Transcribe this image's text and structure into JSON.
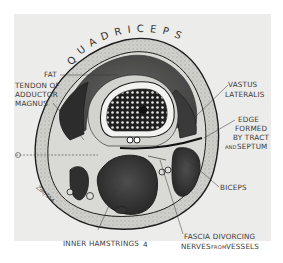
{
  "diagram": {
    "title": "QUADRICEPS",
    "background_color": "#ececea",
    "labels": {
      "fat": "FAT",
      "tendon_line1": "TENDON OF",
      "tendon_line2": "ADDUCTOR",
      "tendon_line3": "MAGNUS",
      "vastus_line1": "VASTUS",
      "vastus_line2": "LATERALIS",
      "edge_line1": "EDGE",
      "edge_line2": "FORMED",
      "edge_line3": "BY TRACT",
      "edge_line4_small": "AND",
      "edge_line4": "SEPTUM",
      "biceps": "BICEPS",
      "inner_hamstrings": "INNER HAMSTRINGS",
      "fascia_line1": "FASCIA DIVORCING",
      "fascia_line2a": "NERVES",
      "fascia_line2_small": "FROM",
      "fascia_line2b": "VESSELS",
      "page_mark": "4",
      "signature": "ZIMJTAA"
    },
    "colors": {
      "outline": "#1e1e1e",
      "muscle_dark": "#2e2e2e",
      "muscle_mid": "#5a5a5a",
      "fat": "#c9c9c5",
      "fascia": "#d8d8d4",
      "bone_cortex": "#f2f2f0",
      "marrow": "#2a2a2a"
    }
  }
}
